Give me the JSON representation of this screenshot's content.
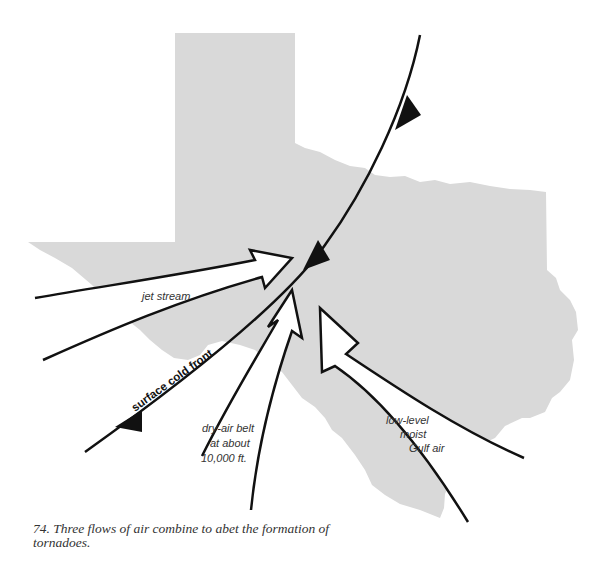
{
  "figure": {
    "colors": {
      "land": "#d9d9d9",
      "line": "#111111",
      "arrow_fill": "#ffffff",
      "background": "#ffffff"
    },
    "map_region": "Texas",
    "labels": {
      "jet_stream": "jet stream",
      "cold_front": "surface cold front",
      "dry_air_line1": "dry-air belt",
      "dry_air_line2": "at about",
      "dry_air_line3": "10,000 ft.",
      "gulf_line1": "low-level",
      "gulf_line2": "moist",
      "gulf_line3": "Gulf air"
    },
    "flows": [
      {
        "name": "jet stream",
        "from": "west",
        "to": "front convergence"
      },
      {
        "name": "dry-air belt at about 10,000 ft.",
        "from": "southwest",
        "to": "front convergence"
      },
      {
        "name": "low-level moist Gulf air",
        "from": "southeast",
        "to": "front convergence"
      }
    ],
    "front": {
      "type": "cold front",
      "label": "surface cold front",
      "triangle_count": 3
    }
  },
  "caption": {
    "text": "74. Three flows of air combine to abet the formation of tornadoes."
  }
}
